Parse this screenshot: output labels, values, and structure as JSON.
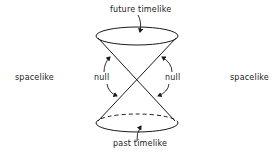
{
  "diagram": {
    "regions": {
      "future": "future timelike",
      "past": "past timelike",
      "null_left": "null",
      "null_right": "null",
      "spacelike_left": "spacelike",
      "spacelike_right": "spacelike"
    },
    "geometry": {
      "apex": [
        137,
        79
      ],
      "top_ellipse": {
        "cx": 137,
        "cy": 36,
        "rx": 41,
        "ry": 9
      },
      "bottom_ellipse": {
        "cx": 137,
        "cy": 123,
        "rx": 41,
        "ry": 9,
        "back_half": "dashed"
      }
    },
    "colors": {
      "ink": "#1a1a1a",
      "background": "#ffffff"
    }
  }
}
